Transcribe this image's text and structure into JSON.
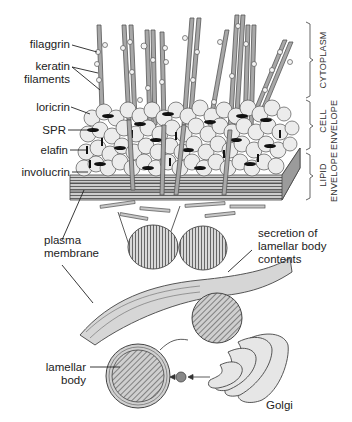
{
  "diagram": {
    "left_labels": [
      {
        "id": "filaggrin",
        "text": "filaggrin"
      },
      {
        "id": "keratin-filaments-1",
        "text": "keratin"
      },
      {
        "id": "keratin-filaments-2",
        "text": "filaments"
      },
      {
        "id": "loricrin",
        "text": "loricrin"
      },
      {
        "id": "spr",
        "text": "SPR"
      },
      {
        "id": "elafin",
        "text": "elafin"
      },
      {
        "id": "involucrin",
        "text": "involucrin"
      },
      {
        "id": "plasma-membrane-1",
        "text": "plasma"
      },
      {
        "id": "plasma-membrane-2",
        "text": "membrane"
      },
      {
        "id": "lamellar-body-1",
        "text": "lamellar"
      },
      {
        "id": "lamellar-body-2",
        "text": "body"
      }
    ],
    "right_labels": [
      {
        "id": "secretion-1",
        "text": "secretion of"
      },
      {
        "id": "secretion-2",
        "text": "lamellar body"
      },
      {
        "id": "secretion-3",
        "text": "contents"
      },
      {
        "id": "golgi",
        "text": "Golgi"
      }
    ],
    "brackets": [
      {
        "id": "cytoplasm",
        "lines": [
          "CYTOPLASM"
        ]
      },
      {
        "id": "cell-envelope",
        "lines": [
          "CELL",
          "ENVELOPE"
        ]
      },
      {
        "id": "lipid-envelope",
        "lines": [
          "LIPID",
          "ENVELOPE"
        ]
      }
    ],
    "colors": {
      "line": "#333333",
      "filament": "#9a9a9a",
      "sphere": "#ececec",
      "black_bar": "#111111",
      "membrane": "#d6d6d6",
      "golgi": "#e4e4e4"
    }
  }
}
